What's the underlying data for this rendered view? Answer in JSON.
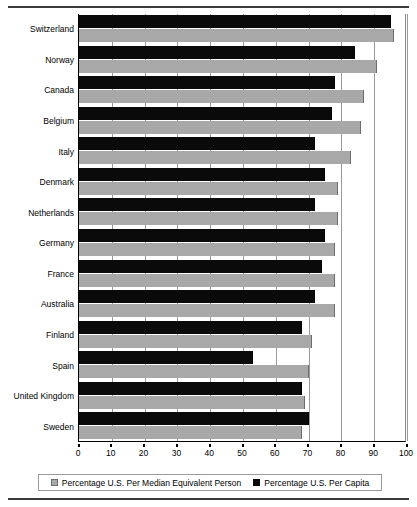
{
  "chart_data": {
    "type": "bar",
    "orientation": "horizontal",
    "title": "",
    "subtitle": "",
    "xlabel": "",
    "ylabel": "",
    "xlim": [
      0,
      100
    ],
    "xticks": [
      0,
      10,
      20,
      30,
      40,
      50,
      60,
      70,
      80,
      90,
      100
    ],
    "grid": true,
    "grid_axis": "x",
    "legend_position": "bottom",
    "categories": [
      "Switzerland",
      "Norway",
      "Canada",
      "Belgium",
      "Italy",
      "Denmark",
      "Netherlands",
      "Germany",
      "France",
      "Australia",
      "Finland",
      "Spain",
      "United Kingdom",
      "Sweden"
    ],
    "series": [
      {
        "name": "Percentage U.S. Per Capita",
        "color": "#0a0a0a",
        "values": [
          95,
          84,
          78,
          77,
          72,
          75,
          72,
          75,
          74,
          72,
          68,
          53,
          68,
          70
        ]
      },
      {
        "name": "Percentage U.S. Per Median Equivalent Person",
        "color": "#a8a8a8",
        "values": [
          96,
          91,
          87,
          86,
          83,
          79,
          79,
          78,
          78,
          78,
          71,
          70,
          69,
          68
        ]
      }
    ]
  },
  "legend": {
    "entries": [
      {
        "label": "Percentage U.S. Per Median Equivalent Person",
        "swatch": "median"
      },
      {
        "label": "Percentage U.S. Per Capita",
        "swatch": "capita"
      }
    ]
  }
}
